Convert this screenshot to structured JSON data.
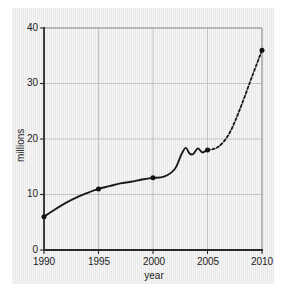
{
  "chart_data": {
    "type": "line",
    "title": "",
    "xlabel": "year",
    "ylabel": "millions",
    "xlim": [
      1990,
      2010
    ],
    "ylim": [
      0,
      40
    ],
    "xticks": [
      1990,
      1995,
      2000,
      2005,
      2010
    ],
    "yticks": [
      0,
      10,
      20,
      30,
      40
    ],
    "xtick_labels": [
      "1990",
      "1995",
      "2000",
      "2005",
      "2010"
    ],
    "ytick_labels": [
      "0",
      "10",
      "20",
      "30",
      "40"
    ],
    "grid": true,
    "legend": "none",
    "series": [
      {
        "name": "observed",
        "style": "solid",
        "color": "#1a1a1a",
        "x": [
          1990,
          1991,
          1992,
          1993,
          1994,
          1995,
          1996,
          1997,
          1998,
          1999,
          2000,
          2001,
          2002,
          2002.6,
          2003.0,
          2003.35,
          2003.7,
          2004.1,
          2004.5,
          2004.8,
          2005
        ],
        "y": [
          6.0,
          7.3,
          8.5,
          9.5,
          10.3,
          11.0,
          11.5,
          12.0,
          12.3,
          12.7,
          13.0,
          13.2,
          14.6,
          17.2,
          18.4,
          17.4,
          17.3,
          18.3,
          17.6,
          17.8,
          18.0
        ]
      },
      {
        "name": "projected",
        "style": "dashed",
        "color": "#1a1a1a",
        "x": [
          2005,
          2006,
          2007,
          2008,
          2009,
          2010
        ],
        "y": [
          18.0,
          18.6,
          21.0,
          25.5,
          30.8,
          36.0
        ]
      }
    ],
    "markers": [
      {
        "x": 1990,
        "y": 6.0,
        "label": "1990"
      },
      {
        "x": 1995,
        "y": 11.0,
        "label": "1995"
      },
      {
        "x": 2000,
        "y": 13.0,
        "label": "2000"
      },
      {
        "x": 2005,
        "y": 18.0,
        "label": "2005"
      },
      {
        "x": 2010,
        "y": 36.0,
        "label": "2010"
      }
    ],
    "colors": {
      "panel_background": "#e9e9e9",
      "page_background": "#ffffff",
      "line": "#1a1a1a",
      "grid": "#b9b9b9",
      "axis": "#2a2a2a",
      "text": "#1b1b1b"
    }
  }
}
